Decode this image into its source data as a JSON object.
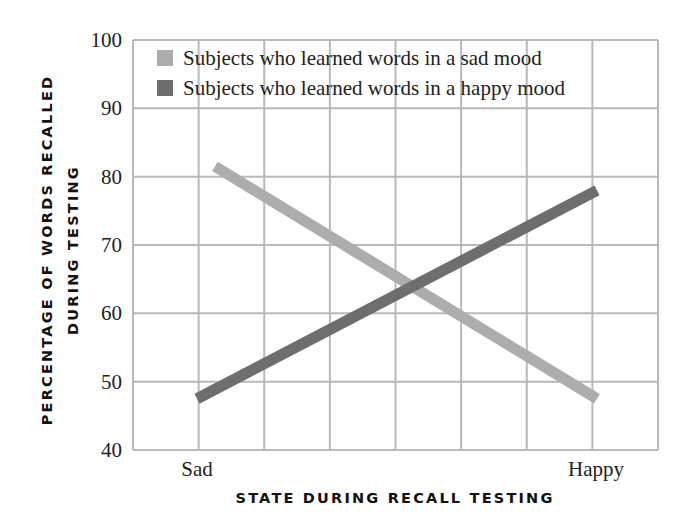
{
  "chart_data": {
    "type": "line",
    "title": "",
    "xlabel": "STATE DURING RECALL TESTING",
    "ylabel_lines": [
      "PERCENTAGE OF WORDS RECALLED",
      "DURING TESTING"
    ],
    "categories": [
      "Sad",
      "Happy"
    ],
    "ylim": [
      40,
      100
    ],
    "yticks": [
      40,
      50,
      60,
      70,
      80,
      90,
      100
    ],
    "grid": true,
    "legend_position": "top",
    "series": [
      {
        "name": "Subjects who learned words in a sad mood",
        "color": "#adadad",
        "values": [
          81.5,
          47.5
        ]
      },
      {
        "name": "Subjects who learned words in a happy mood",
        "color": "#6e6e6e",
        "values": [
          47.5,
          78
        ]
      }
    ]
  }
}
